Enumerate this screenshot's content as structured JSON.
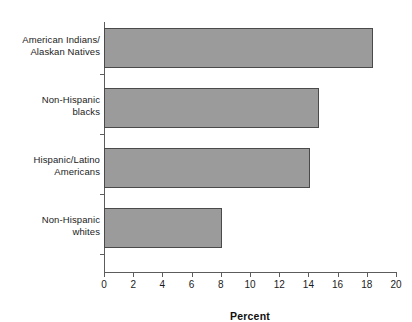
{
  "chart_data": {
    "type": "bar",
    "orientation": "horizontal",
    "title": "",
    "xlabel": "Percent",
    "ylabel": "",
    "xlim": [
      0,
      20
    ],
    "xticks": [
      0,
      2,
      4,
      6,
      8,
      10,
      12,
      14,
      16,
      18,
      20
    ],
    "grid": false,
    "legend": false,
    "categories": [
      "American Indians/ Alaskan Natives",
      "Non-Hispanic blacks",
      "Hispanic/Latino Americans",
      "Non-Hispanic whites"
    ],
    "category_lines": [
      [
        "American Indians/",
        "Alaskan Natives"
      ],
      [
        "Non-Hispanic",
        "blacks"
      ],
      [
        "Hispanic/Latino",
        "Americans"
      ],
      [
        "Non-Hispanic",
        "whites"
      ]
    ],
    "values": [
      18.4,
      14.7,
      14.1,
      8.1
    ],
    "bar_fill_color": "#9b9b9b",
    "bar_border_color": "#4a4a4a",
    "axis_color": "#5c5c5c"
  },
  "axis": {
    "x_title": "Percent",
    "tick_labels": [
      "0",
      "2",
      "4",
      "6",
      "8",
      "10",
      "12",
      "14",
      "16",
      "18",
      "20"
    ]
  },
  "categories": {
    "c0": {
      "line1": "American Indians/",
      "line2": "Alaskan Natives"
    },
    "c1": {
      "line1": "Non-Hispanic",
      "line2": "blacks"
    },
    "c2": {
      "line1": "Hispanic/Latino",
      "line2": "Americans"
    },
    "c3": {
      "line1": "Non-Hispanic",
      "line2": "whites"
    }
  }
}
